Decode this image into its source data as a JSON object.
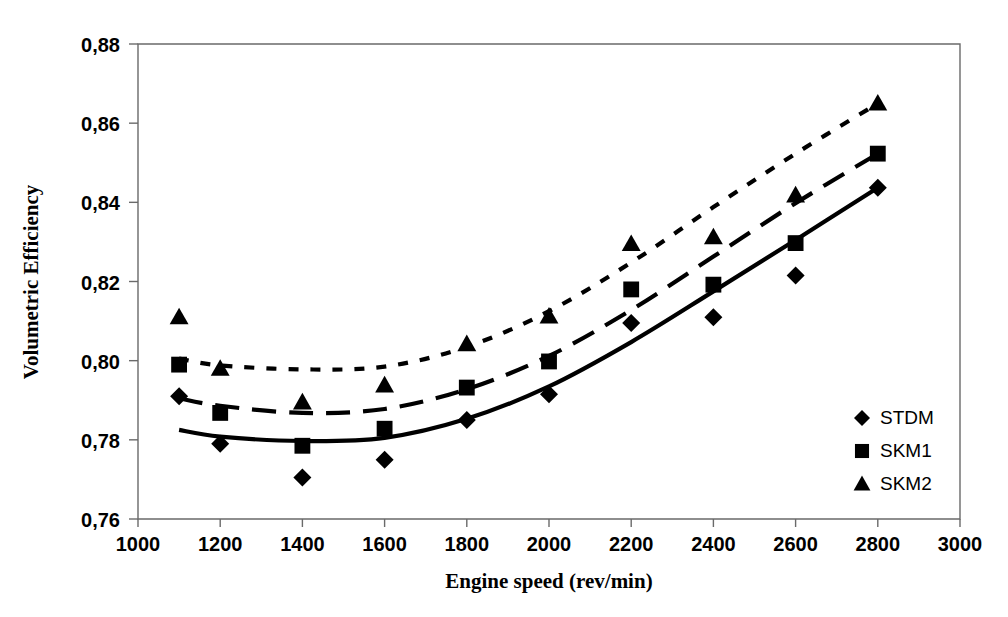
{
  "chart_data": {
    "type": "scatter",
    "title": "",
    "xlabel": "Engine speed (rev/min)",
    "ylabel": "Volumetric Efficiency",
    "xlim": [
      1000,
      3000
    ],
    "ylim": [
      0.76,
      0.88
    ],
    "xticks": [
      1000,
      1200,
      1400,
      1600,
      1800,
      2000,
      2200,
      2400,
      2600,
      2800,
      3000
    ],
    "xtick_labels": [
      "1000",
      "1200",
      "1400",
      "1600",
      "1800",
      "2000",
      "2200",
      "2400",
      "2600",
      "2800",
      "3000"
    ],
    "yticks": [
      0.76,
      0.78,
      0.8,
      0.82,
      0.84,
      0.86,
      0.88
    ],
    "ytick_labels": [
      "0,76",
      "0,78",
      "0,80",
      "0,82",
      "0,84",
      "0,86",
      "0,88"
    ],
    "grid": false,
    "legend_position": "right-inside",
    "x": [
      1100,
      1200,
      1400,
      1600,
      1800,
      2000,
      2200,
      2400,
      2600,
      2800
    ],
    "series": [
      {
        "name": "STDM",
        "marker": "diamond",
        "line_style": "solid",
        "color": "#000000",
        "values": [
          0.791,
          0.779,
          0.7705,
          0.775,
          0.785,
          0.7915,
          0.8095,
          0.811,
          0.8215,
          0.8437
        ],
        "fit": [
          0.7825,
          0.7808,
          0.7797,
          0.7805,
          0.7853,
          0.7935,
          0.8047,
          0.8175,
          0.8305,
          0.8437
        ]
      },
      {
        "name": "SKM1",
        "marker": "square",
        "line_style": "dashed",
        "color": "#000000",
        "values": [
          0.799,
          0.7868,
          0.7785,
          0.7828,
          0.7932,
          0.7998,
          0.818,
          0.8192,
          0.8297,
          0.8523
        ],
        "fit": [
          0.7905,
          0.7886,
          0.7868,
          0.7878,
          0.7928,
          0.8012,
          0.8128,
          0.8263,
          0.8398,
          0.8523
        ]
      },
      {
        "name": "SKM2",
        "marker": "triangle",
        "line_style": "dotted",
        "color": "#000000",
        "values": [
          0.811,
          0.798,
          0.7895,
          0.7938,
          0.8042,
          0.8112,
          0.8295,
          0.8312,
          0.8418,
          0.865
        ],
        "fit": [
          0.8005,
          0.7988,
          0.7978,
          0.7985,
          0.8035,
          0.8125,
          0.8248,
          0.8388,
          0.8523,
          0.865
        ]
      }
    ],
    "legend": [
      {
        "label": "STDM",
        "marker": "diamond"
      },
      {
        "label": "SKM1",
        "marker": "square"
      },
      {
        "label": "SKM2",
        "marker": "triangle"
      }
    ]
  }
}
